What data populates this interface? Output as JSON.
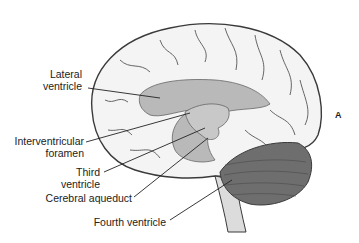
{
  "figure": {
    "panel_letter": "A",
    "labels": [
      {
        "id": "lateral-ventricle",
        "line1": "Lateral",
        "line2": "ventricle"
      },
      {
        "id": "interventricular-foramen",
        "line1": "Interventricular",
        "line2": "foramen"
      },
      {
        "id": "third-ventricle",
        "line1": "Third",
        "line2": "ventricle"
      },
      {
        "id": "cerebral-aqueduct",
        "line1": "Cerebral aqueduct"
      },
      {
        "id": "fourth-ventricle",
        "line1": "Fourth ventricle"
      }
    ],
    "colors": {
      "brain_fill": "#f4f4f4",
      "brain_outline": "#3a3a3a",
      "ventricle_fill": "#b9b9b9",
      "cerebellum_fill": "#6e6e6e",
      "leader_line": "#222222"
    }
  }
}
